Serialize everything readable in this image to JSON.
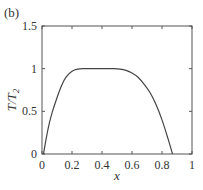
{
  "panel_label": "(b)",
  "chart_data": {
    "type": "line",
    "title": "",
    "xlabel": "x",
    "ylabel": "T/T",
    "ylabel_sub": "2",
    "xlim": [
      0,
      1
    ],
    "ylim": [
      0,
      1.5
    ],
    "xticks": [
      "0",
      "0.2",
      "0.4",
      "0.6",
      "0.8",
      "1"
    ],
    "yticks": [
      "0",
      "0.5",
      "1",
      "1.5"
    ],
    "grid": false,
    "legend": null,
    "series": [
      {
        "name": "T/T2",
        "x": [
          0.01,
          0.03,
          0.05,
          0.07,
          0.1,
          0.13,
          0.16,
          0.2,
          0.24,
          0.28,
          0.32,
          0.4,
          0.48,
          0.52,
          0.56,
          0.6,
          0.64,
          0.68,
          0.72,
          0.76,
          0.8,
          0.84,
          0.87
        ],
        "values": [
          0.0,
          0.2,
          0.37,
          0.5,
          0.66,
          0.8,
          0.9,
          0.97,
          0.995,
          1.0,
          1.0,
          1.0,
          1.0,
          0.995,
          0.98,
          0.95,
          0.9,
          0.82,
          0.72,
          0.58,
          0.4,
          0.18,
          0.0
        ]
      }
    ]
  }
}
